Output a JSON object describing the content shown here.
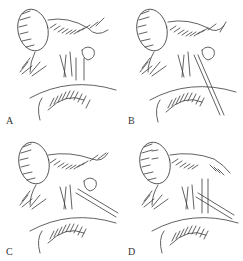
{
  "figure": {
    "type": "anatomical surgical illustration",
    "style": "black-and-white pen hatching",
    "ink_color": "#3a3a3a",
    "background": "#ffffff",
    "panels": [
      {
        "label": "A",
        "description": "gallbladder with hatched surrounding tissue and ductal structures, straight vertical duct"
      },
      {
        "label": "B",
        "description": "gallbladder with ducts; instrument/tube inserted diagonally"
      },
      {
        "label": "C",
        "description": "gallbladder with ducts; probe passed diagonally to lower right"
      },
      {
        "label": "D",
        "description": "gallbladder with dissected ducts; diagonal tube placed, vertical duct exposed"
      }
    ]
  }
}
